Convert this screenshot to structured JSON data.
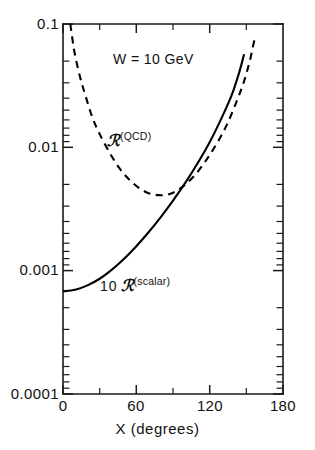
{
  "chart_data": {
    "type": "line",
    "title": "",
    "xlabel": "X  (degrees)",
    "ylabel": "",
    "xlim": [
      0,
      180
    ],
    "ylim": [
      0.0001,
      0.1
    ],
    "yscale": "log",
    "xscale": "linear",
    "grid": false,
    "legend_position": "inline-annotations",
    "x_ticks_major": [
      0,
      60,
      120,
      180
    ],
    "x_tick_labels": [
      "0",
      "60",
      "120",
      "180"
    ],
    "x_ticks_minor": [
      30,
      90,
      150
    ],
    "y_ticks_major": [
      0.1,
      0.01,
      0.001,
      0.0001
    ],
    "y_tick_labels": [
      "0.1",
      "0.01",
      "0.001",
      "0.0001"
    ],
    "annotations": [
      {
        "name": "energy-annotation",
        "text": "W = 10 GeV",
        "x": 55,
        "y": 0.045
      }
    ],
    "series": [
      {
        "name": "R_QCD",
        "label_base": "ℛ",
        "label_sup": "(QCD)",
        "style": "dashed",
        "color": "#000000",
        "x": [
          6,
          8,
          10,
          14,
          18,
          24,
          30,
          38,
          46,
          54,
          62,
          70,
          78,
          86,
          94,
          102,
          110,
          118,
          126,
          134,
          142,
          148,
          153,
          157
        ],
        "y": [
          0.1,
          0.072,
          0.055,
          0.037,
          0.027,
          0.0175,
          0.0128,
          0.0091,
          0.0068,
          0.0055,
          0.0047,
          0.00425,
          0.0041,
          0.00415,
          0.0045,
          0.0052,
          0.0063,
          0.0081,
          0.0108,
          0.0152,
          0.0235,
          0.034,
          0.051,
          0.078
        ]
      },
      {
        "name": "10_R_scalar",
        "label_prefix": "10",
        "label_base": "ℛ",
        "label_sup": "(scalar)",
        "style": "solid",
        "color": "#000000",
        "x": [
          0,
          10,
          20,
          30,
          40,
          50,
          60,
          70,
          80,
          90,
          100,
          110,
          120,
          130,
          138,
          144,
          148
        ],
        "y": [
          0.00068,
          0.0007,
          0.00076,
          0.00086,
          0.00102,
          0.00125,
          0.00158,
          0.00205,
          0.00272,
          0.0037,
          0.00515,
          0.0074,
          0.011,
          0.0175,
          0.0265,
          0.04,
          0.056
        ]
      }
    ]
  },
  "axes": {
    "x_axis_title": "X  (degrees)",
    "x_tick_labels": [
      "0",
      "60",
      "120",
      "180"
    ],
    "y_tick_labels": [
      "0.1",
      "0.01",
      "0.001",
      "0.0001"
    ]
  },
  "labels": {
    "energy": "W = 10 GeV",
    "qcd_base": "ℛ",
    "qcd_sup": "(QCD)",
    "scalar_prefix": "10",
    "scalar_base": "ℛ",
    "scalar_sup": "(scalar)"
  },
  "colors": {
    "axis": "#1a1a1a",
    "curve": "#000000",
    "background": "#ffffff"
  }
}
